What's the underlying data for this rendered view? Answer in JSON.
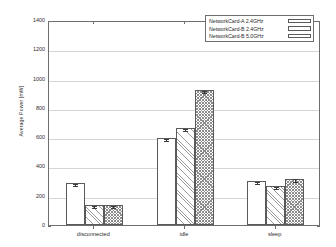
{
  "chart_data": {
    "type": "bar",
    "title": "",
    "xlabel": "",
    "ylabel": "Average Power [mW]",
    "categories": [
      "disconnected",
      "idle",
      "sleep"
    ],
    "ylim": [
      0,
      1400
    ],
    "ytick_values": [
      0,
      200,
      400,
      600,
      800,
      1000,
      1200,
      1400
    ],
    "ytick_labels": [
      "0",
      "200",
      "400",
      "600",
      "800",
      "1000",
      "1200",
      "1400"
    ],
    "grid": true,
    "legend_position": "top-right",
    "series": [
      {
        "name": "NetworkCard-A 2.4GHz",
        "pattern": "dotted",
        "values": [
          290,
          593,
          302
        ],
        "errors": [
          6,
          5,
          7
        ]
      },
      {
        "name": "NetworkCard-B 2.4GHz",
        "pattern": "diagonal-lines",
        "values": [
          139,
          665,
          266
        ],
        "errors": [
          3,
          5,
          5
        ]
      },
      {
        "name": "NetworkCard-B 5.0GHz",
        "pattern": "crosshatch",
        "values": [
          138,
          923,
          315
        ],
        "errors": [
          3,
          6,
          11
        ]
      }
    ]
  },
  "axis": {
    "ylabel": "Average Power [mW]"
  },
  "legend": {
    "items": [
      {
        "label": "NetworkCard-A 2.4GHz"
      },
      {
        "label": "NetworkCard-B 2.4GHz"
      },
      {
        "label": "NetworkCard-B 5.0GHz"
      }
    ]
  }
}
